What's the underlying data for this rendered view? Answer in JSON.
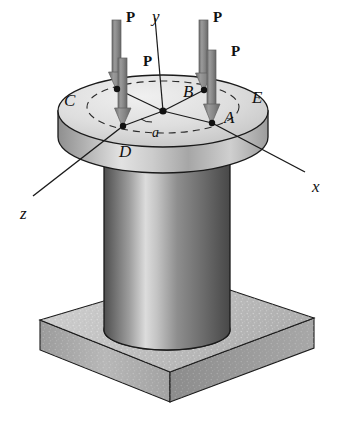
{
  "figure": {
    "background_color": "#ffffff",
    "width": 338,
    "height": 429
  },
  "colors": {
    "outline": "#1a1a1a",
    "arrow_fill": "#8a8a8a",
    "arrow_edge": "#5e5e5e",
    "disk_top_light": "#e8e8e8",
    "disk_top_mid": "#cfcfcf",
    "disk_rim_dark": "#9a9a9a",
    "cylinder_dark": "#5a5a5a",
    "cylinder_light": "#d8d8d8",
    "base_top": "#c8c8c8",
    "base_front": "#b0b0b0",
    "base_side": "#8f8f8f",
    "dashed_line": "#2a2a2a",
    "axis_line": "#1a1a1a"
  },
  "axes": [
    {
      "id": "y",
      "label": "y",
      "x": 152,
      "y": 8,
      "description": "vertical axis upward from center"
    },
    {
      "id": "x",
      "label": "x",
      "x": 312,
      "y": 178,
      "description": "axis to lower right"
    },
    {
      "id": "z",
      "label": "z",
      "x": 20,
      "y": 205,
      "description": "axis to lower left"
    }
  ],
  "points": [
    {
      "id": "A",
      "label": "A",
      "label_x": 224,
      "label_y": 109,
      "dot_x": 212,
      "dot_y": 123,
      "description": "load point on +x side"
    },
    {
      "id": "B",
      "label": "B",
      "label_x": 183,
      "label_y": 83,
      "dot_x": 204,
      "dot_y": 90,
      "description": "load point on -z side"
    },
    {
      "id": "C",
      "label": "C",
      "label_x": 64,
      "label_y": 92,
      "dot_x": 117,
      "dot_y": 89,
      "description": "load point on -x side"
    },
    {
      "id": "D",
      "label": "D",
      "label_x": 119,
      "label_y": 143,
      "dot_x": 123,
      "dot_y": 126,
      "description": "load point on +z side"
    },
    {
      "id": "E",
      "label": "E",
      "label_x": 252,
      "label_y": 89,
      "dot_x": null,
      "dot_y": null,
      "description": "point on outer edge of flange disk"
    }
  ],
  "center": {
    "x": 163,
    "y": 111,
    "label": "",
    "description": "centroid of circular cross-section"
  },
  "dimensions": [
    {
      "id": "a",
      "label": "a",
      "x": 152,
      "y": 126,
      "description": "radius of the circle through A, B, C, D"
    }
  ],
  "forces": [
    {
      "id": "P-to-C",
      "label": "P",
      "label_x": 126,
      "label_y": 10,
      "applied_at": "C",
      "arrow_x": 117,
      "arrow_top": 20,
      "arrow_tip": 89,
      "style": "tall"
    },
    {
      "id": "P-to-B",
      "label": "P",
      "label_x": 213,
      "label_y": 10,
      "applied_at": "B",
      "arrow_x": 204,
      "arrow_top": 20,
      "arrow_tip": 90,
      "style": "tall"
    },
    {
      "id": "P-to-D",
      "label": "P",
      "label_x": 143,
      "label_y": 54,
      "arrow_x": 123,
      "applied_at": "D",
      "arrow_top": 58,
      "arrow_tip": 126,
      "style": "short"
    },
    {
      "id": "P-to-A",
      "label": "P",
      "label_x": 231,
      "label_y": 44,
      "arrow_x": 212,
      "applied_at": "A",
      "arrow_top": 50,
      "arrow_tip": 123,
      "style": "short"
    }
  ],
  "geometry": {
    "disk": {
      "center_x": 163,
      "center_y": 111,
      "rx": 105,
      "ry": 36,
      "thickness": 26,
      "description": "flange disk at top of column"
    },
    "load_circle": {
      "center_x": 163,
      "center_y": 107,
      "rx": 76,
      "ry": 26,
      "dashed": true,
      "description": "dashed circle of radius a through load points"
    },
    "cylinder": {
      "center_x": 167,
      "top_y": 147,
      "bottom_y": 330,
      "rx": 63,
      "ry": 20,
      "description": "vertical circular column shaft"
    },
    "base_plate": {
      "description": "square base plate drawn in isometric projection with speckled texture",
      "top_face": [
        [
          40,
          320
        ],
        [
          188,
          276
        ],
        [
          314,
          318
        ],
        [
          170,
          372
        ]
      ],
      "thickness": 42
    }
  }
}
